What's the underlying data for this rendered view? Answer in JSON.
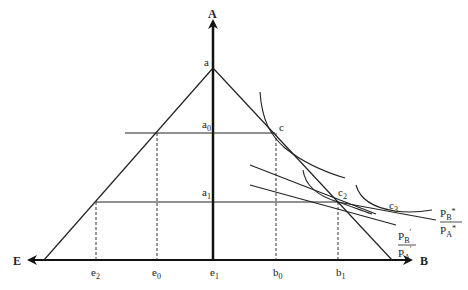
{
  "axes": {
    "vertical": "A",
    "right": "B",
    "left": "E"
  },
  "points": {
    "apex": "a",
    "a0": {
      "base": "a",
      "sub": "0"
    },
    "a1": {
      "base": "a",
      "sub": "1"
    },
    "c": "c",
    "c2": {
      "base": "c",
      "sub": "2"
    },
    "c3": {
      "base": "c",
      "sub": "3"
    }
  },
  "ticks": [
    {
      "base": "e",
      "sub": "2"
    },
    {
      "base": "e",
      "sub": "0"
    },
    {
      "base": "e",
      "sub": "1"
    },
    {
      "base": "b",
      "sub": "0"
    },
    {
      "base": "b",
      "sub": "1"
    }
  ],
  "price_ratios": {
    "prime": {
      "num": "P",
      "num_sub": "B",
      "num_sup": "'",
      "den": "P",
      "den_sub": "A",
      "den_sup": "'"
    },
    "star": {
      "num": "P",
      "num_sub": "B",
      "num_sup": "*",
      "den": "P",
      "den_sub": "A",
      "den_sup": "*"
    }
  }
}
